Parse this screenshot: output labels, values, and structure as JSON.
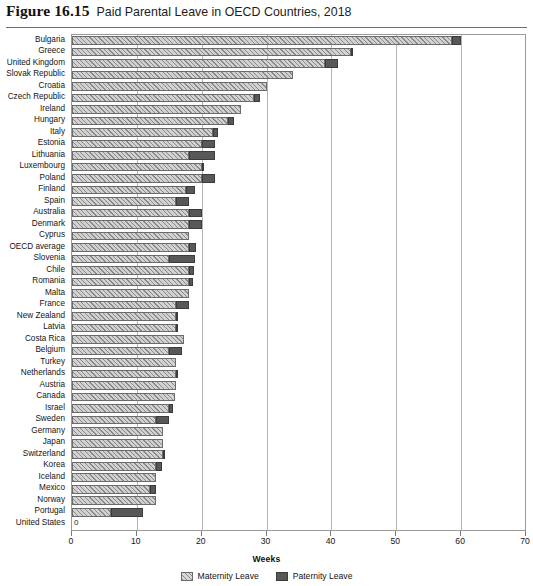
{
  "figure": {
    "number": "Figure 16.15",
    "title": "Paid Parental Leave in OECD Countries, 2018"
  },
  "legend": {
    "maternity_label": "Maternity Leave",
    "paternity_label": "Paternity Leave",
    "maternity_color": "#d2d2d2",
    "paternity_color": "#585858",
    "position": "bottom-center"
  },
  "chart_data": {
    "type": "bar",
    "orientation": "horizontal",
    "stacked": true,
    "title": "Paid Parental Leave in OECD Countries, 2018",
    "xlabel": "Weeks",
    "ylabel": "",
    "xlim": [
      0,
      70
    ],
    "xticks": [
      0,
      10,
      20,
      30,
      40,
      50,
      60,
      70
    ],
    "xtick_labels": [
      "0",
      "10",
      "20",
      "30",
      "40",
      "50",
      "60",
      "70"
    ],
    "grid": true,
    "grid_axis": "x",
    "categories": [
      "Bulgaria",
      "Greece",
      "United Kingdom",
      "Slovak Republic",
      "Croatia",
      "Czech Republic",
      "Ireland",
      "Hungary",
      "Italy",
      "Estonia",
      "Lithuania",
      "Luxembourg",
      "Poland",
      "Finland",
      "Spain",
      "Australia",
      "Denmark",
      "Cyprus",
      "OECD average",
      "Slovenia",
      "Chile",
      "Romania",
      "Malta",
      "France",
      "New Zealand",
      "Latvia",
      "Costa Rica",
      "Belgium",
      "Turkey",
      "Netherlands",
      "Austria",
      "Canada",
      "Israel",
      "Sweden",
      "Germany",
      "Japan",
      "Switzerland",
      "Korea",
      "Iceland",
      "Mexico",
      "Norway",
      "Portugal",
      "United States"
    ],
    "series": [
      {
        "name": "Maternity Leave",
        "values": [
          58.6,
          43.0,
          39.0,
          34.0,
          30.0,
          28.0,
          26.0,
          24.0,
          21.7,
          20.0,
          18.0,
          20.0,
          20.0,
          17.5,
          16.0,
          18.0,
          18.0,
          18.0,
          18.1,
          15.0,
          18.0,
          18.0,
          18.0,
          16.0,
          16.0,
          16.0,
          17.3,
          15.0,
          16.0,
          16.0,
          16.0,
          15.9,
          15.0,
          12.9,
          14.0,
          14.0,
          14.0,
          12.9,
          13.0,
          12.0,
          13.0,
          6.0,
          0.0
        ]
      },
      {
        "name": "Paternity Leave",
        "values": [
          1.4,
          0.4,
          2.0,
          0.0,
          0.0,
          1.0,
          0.0,
          1.0,
          0.8,
          2.0,
          4.0,
          0.4,
          2.0,
          1.5,
          2.1,
          2.0,
          2.0,
          0.0,
          1.0,
          4.0,
          0.8,
          0.7,
          0.0,
          2.0,
          0.4,
          0.2,
          0.0,
          2.0,
          0.0,
          0.4,
          0.0,
          0.0,
          0.6,
          2.1,
          0.0,
          0.0,
          0.3,
          1.0,
          0.0,
          1.0,
          0.0,
          5.0,
          0.0
        ]
      }
    ],
    "totals": [
      60.0,
      43.4,
      41.0,
      34.0,
      30.0,
      29.0,
      26.0,
      25.0,
      22.5,
      22.0,
      22.0,
      20.4,
      22.0,
      19.0,
      18.1,
      20.0,
      20.0,
      18.0,
      19.1,
      19.0,
      18.8,
      18.7,
      18.0,
      18.0,
      16.4,
      16.2,
      17.3,
      17.0,
      16.0,
      16.4,
      16.0,
      15.9,
      15.6,
      15.0,
      14.0,
      14.0,
      14.3,
      13.9,
      13.0,
      13.0,
      13.0,
      11.0,
      0.0
    ],
    "zero_value_label": "0",
    "zero_value_country": "United States"
  }
}
